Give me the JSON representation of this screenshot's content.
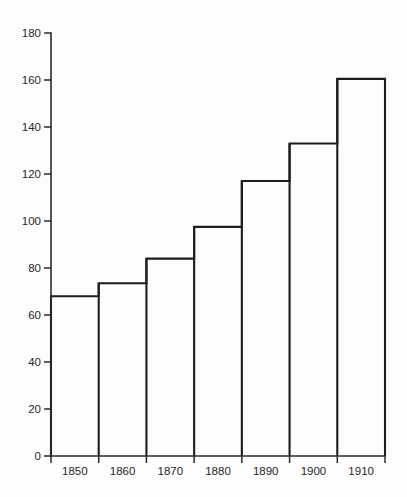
{
  "chart_data": {
    "type": "bar",
    "title": "",
    "subtitle": "",
    "xlabel": "",
    "ylabel": "",
    "categories": [
      "1850",
      "1860",
      "1870",
      "1880",
      "1890",
      "1900",
      "1910"
    ],
    "values": [
      68,
      73.5,
      84,
      97.5,
      117,
      133,
      160.5
    ],
    "series": [
      {
        "name": "",
        "values": [
          68,
          73.5,
          84,
          97.5,
          117,
          133,
          160.5
        ]
      }
    ],
    "ylim": [
      0,
      180
    ],
    "y_ticks": [
      0,
      20,
      40,
      60,
      80,
      100,
      120,
      140,
      160,
      180
    ],
    "y_tick_labels": [
      "0",
      "20",
      "40",
      "60",
      "80",
      "100",
      "120",
      "140",
      "160",
      "180"
    ],
    "x_tick_labels": [
      "1850",
      "1860",
      "1870",
      "1880",
      "1890",
      "1900",
      "1910"
    ],
    "grid": false,
    "legend": false,
    "legend_position": "none",
    "annotations": [],
    "bar_style": "outline-only",
    "bars_adjacent": true,
    "colors": {
      "background": "#fdfdfd",
      "axis": "#2a2a2a",
      "bar_stroke": "#1d1d1d",
      "bar_fill": "none",
      "text": "#262626"
    }
  },
  "chart": {
    "y_axis_name": "y-axis",
    "x_axis_name": "x-axis"
  }
}
